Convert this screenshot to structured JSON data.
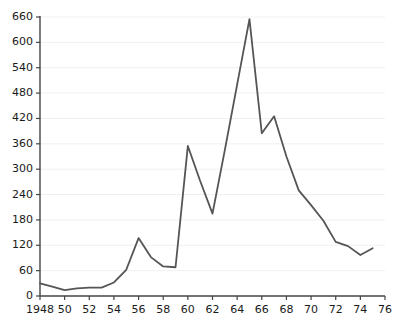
{
  "chart_data": {
    "type": "line",
    "title": "",
    "subtitle": "",
    "xlabel": "",
    "ylabel": "",
    "grid": true,
    "legend": false,
    "legend_position": "none",
    "line_color": "#555555",
    "grid_color": "#f0f0f0",
    "axis_color": "#444444",
    "background_color": "#ffffff",
    "xlim": [
      1948,
      1976
    ],
    "ylim": [
      0,
      660
    ],
    "x_tick_labels": [
      "1948",
      "50",
      "52",
      "54",
      "56",
      "58",
      "60",
      "62",
      "64",
      "66",
      "68",
      "70",
      "72",
      "74",
      "76"
    ],
    "x_tick_values": [
      1948,
      1950,
      1952,
      1954,
      1956,
      1958,
      1960,
      1962,
      1964,
      1966,
      1968,
      1970,
      1972,
      1974,
      1976
    ],
    "y_tick_labels": [
      "0",
      "60",
      "120",
      "180",
      "240",
      "300",
      "360",
      "420",
      "480",
      "540",
      "600",
      "660"
    ],
    "y_tick_values": [
      0,
      60,
      120,
      180,
      240,
      300,
      360,
      420,
      480,
      540,
      600,
      660
    ],
    "x": [
      1948,
      1949,
      1950,
      1951,
      1952,
      1953,
      1954,
      1955,
      1956,
      1957,
      1958,
      1959,
      1960,
      1961,
      1962,
      1963,
      1964,
      1965,
      1966,
      1967,
      1968,
      1969,
      1970,
      1971,
      1972,
      1973,
      1974,
      1975
    ],
    "values": [
      30,
      22,
      14,
      18,
      20,
      20,
      32,
      62,
      137,
      92,
      70,
      68,
      355,
      272,
      195,
      345,
      500,
      655,
      385,
      425,
      330,
      250,
      215,
      178,
      128,
      118,
      97,
      113
    ],
    "series": [
      {
        "name": "series-1",
        "values": [
          30,
          22,
          14,
          18,
          20,
          20,
          32,
          62,
          137,
          92,
          70,
          68,
          355,
          272,
          195,
          345,
          500,
          655,
          385,
          425,
          330,
          250,
          215,
          178,
          128,
          118,
          97,
          113
        ]
      }
    ]
  },
  "plot": {
    "left": 40,
    "right": 385,
    "top": 17,
    "bottom": 296
  }
}
